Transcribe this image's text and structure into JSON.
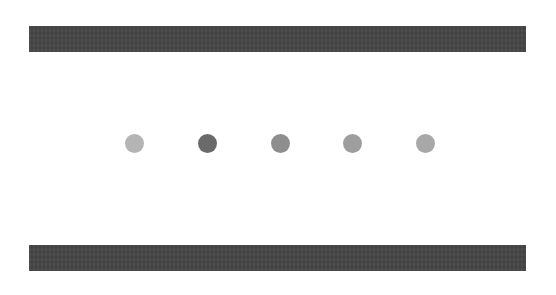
{
  "top_bar": {
    "color": "#444444"
  },
  "bottom_bar": {
    "color": "#444444"
  },
  "pagination": {
    "count": 5,
    "active_index": 1,
    "dots": [
      {
        "label": "Slide 1",
        "color": "#b4b4b4",
        "x": 125
      },
      {
        "label": "Slide 2",
        "color": "#6a6a6a",
        "x": 198
      },
      {
        "label": "Slide 3",
        "color": "#8e8e8e",
        "x": 271
      },
      {
        "label": "Slide 4",
        "color": "#9e9e9e",
        "x": 343
      },
      {
        "label": "Slide 5",
        "color": "#a8a8a8",
        "x": 416
      }
    ]
  }
}
